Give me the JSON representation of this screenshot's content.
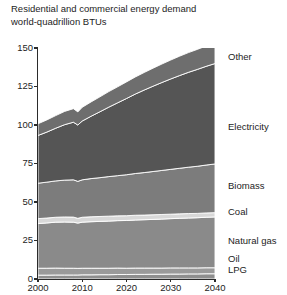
{
  "chart_data": {
    "type": "area",
    "title": "Residential and commercial energy demand\nworld-quadrillion BTUs",
    "xlabel": "",
    "ylabel": "",
    "stacked": true,
    "grid": false,
    "legend_position": "right-inline",
    "xlim": [
      2000,
      2040
    ],
    "ylim": [
      0,
      150
    ],
    "yticks": [
      0,
      25,
      50,
      75,
      100,
      125,
      150
    ],
    "xticks": [
      2000,
      2010,
      2020,
      2030,
      2040
    ],
    "x": [
      2000,
      2002,
      2004,
      2006,
      2008,
      2009,
      2010,
      2012,
      2014,
      2016,
      2018,
      2020,
      2022,
      2024,
      2026,
      2028,
      2030,
      2032,
      2034,
      2036,
      2038,
      2040
    ],
    "series": [
      {
        "name": "LPG",
        "color": "#8e8e8e",
        "values": [
          2.5,
          2.5,
          2.6,
          2.6,
          2.6,
          2.6,
          2.7,
          2.7,
          2.8,
          2.8,
          2.9,
          2.9,
          3.0,
          3.0,
          3.1,
          3.1,
          3.2,
          3.2,
          3.3,
          3.3,
          3.4,
          3.4
        ]
      },
      {
        "name": "Oil",
        "color": "#9a9a9a",
        "values": [
          4.5,
          4.5,
          4.5,
          4.4,
          4.4,
          4.3,
          4.3,
          4.3,
          4.2,
          4.2,
          4.2,
          4.1,
          4.1,
          4.1,
          4.0,
          4.0,
          4.0,
          4.0,
          3.9,
          3.9,
          3.9,
          3.9
        ]
      },
      {
        "name": "Natural gas",
        "color": "#8a8a8a",
        "values": [
          29.0,
          29.4,
          29.8,
          30.0,
          29.9,
          29.4,
          29.9,
          30.2,
          30.4,
          30.6,
          30.8,
          31.0,
          31.2,
          31.4,
          31.6,
          31.8,
          32.0,
          32.2,
          32.4,
          32.6,
          32.8,
          33.0
        ]
      },
      {
        "name": "Coal",
        "color": "#d8d8d8",
        "values": [
          3.2,
          3.2,
          3.2,
          3.3,
          3.3,
          3.1,
          3.2,
          3.2,
          3.2,
          3.2,
          3.1,
          3.1,
          3.1,
          3.0,
          3.0,
          3.0,
          2.9,
          2.9,
          2.9,
          2.8,
          2.8,
          2.8
        ]
      },
      {
        "name": "Biomass",
        "color": "#7c7c7c",
        "values": [
          23.0,
          23.3,
          23.6,
          23.9,
          24.2,
          24.0,
          24.3,
          24.8,
          25.2,
          25.7,
          26.1,
          26.6,
          27.1,
          27.6,
          28.1,
          28.6,
          29.1,
          29.6,
          30.1,
          30.6,
          31.1,
          31.6
        ]
      },
      {
        "name": "Electricity",
        "color": "#555555",
        "values": [
          31.0,
          32.5,
          34.2,
          36.0,
          37.4,
          36.6,
          38.2,
          40.5,
          42.8,
          45.1,
          47.3,
          49.5,
          51.6,
          53.6,
          55.4,
          57.1,
          58.7,
          60.2,
          61.6,
          62.9,
          64.1,
          65.2
        ]
      },
      {
        "name": "Other",
        "color": "#6e6e6e",
        "values": [
          7.6,
          7.9,
          8.2,
          8.6,
          8.8,
          8.5,
          8.9,
          9.3,
          9.7,
          10.1,
          10.4,
          10.8,
          11.1,
          11.4,
          11.7,
          12.0,
          12.3,
          12.6,
          12.8,
          13.0,
          13.2,
          13.4
        ]
      }
    ],
    "series_labels": [
      {
        "name": "Other",
        "y_px": 57
      },
      {
        "name": "Electricity",
        "y_px": 127
      },
      {
        "name": "Biomass",
        "y_px": 186
      },
      {
        "name": "Coal",
        "y_px": 212
      },
      {
        "name": "Natural gas",
        "y_px": 241
      },
      {
        "name": "Oil",
        "y_px": 259
      },
      {
        "name": "LPG",
        "y_px": 270
      }
    ]
  }
}
